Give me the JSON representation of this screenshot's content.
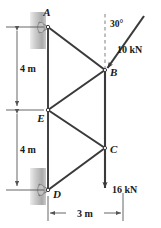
{
  "figure": {
    "type": "truss-free-body-diagram",
    "background_color": "#ffffff",
    "member_color": "#3a3a3a",
    "dimension_color": "#555555",
    "wall_color": "#b3b3b3",
    "support_color": "#9a9a9a"
  },
  "joints": {
    "A": {
      "label": "A",
      "x": 48,
      "y": 27,
      "support": "pin"
    },
    "B": {
      "label": "B",
      "x": 105,
      "y": 70,
      "support": "none"
    },
    "E": {
      "label": "E",
      "x": 48,
      "y": 110,
      "support": "none"
    },
    "C": {
      "label": "C",
      "x": 105,
      "y": 148,
      "support": "none"
    },
    "D": {
      "label": "D",
      "x": 48,
      "y": 190,
      "support": "pin"
    }
  },
  "members": [
    {
      "from": "A",
      "to": "E"
    },
    {
      "from": "E",
      "to": "D"
    },
    {
      "from": "A",
      "to": "B"
    },
    {
      "from": "E",
      "to": "B"
    },
    {
      "from": "E",
      "to": "C"
    },
    {
      "from": "D",
      "to": "C"
    },
    {
      "from": "B",
      "to": "C"
    }
  ],
  "loads": [
    {
      "name": "load-10kN",
      "label": "10 kN",
      "magnitude": 10,
      "unit": "kN",
      "applied_at": "B",
      "angle_label": "30°",
      "angle_value": 30,
      "angle_reference": "vertical",
      "direction": "down-left"
    },
    {
      "name": "load-16kN",
      "label": "16 kN",
      "magnitude": 16,
      "unit": "kN",
      "applied_at": "C",
      "direction": "down"
    }
  ],
  "dimensions": [
    {
      "name": "dim-upper-4m",
      "label": "4 m",
      "value": 4,
      "unit": "m",
      "orientation": "vertical",
      "span": "A-to-E"
    },
    {
      "name": "dim-lower-4m",
      "label": "4 m",
      "value": 4,
      "unit": "m",
      "orientation": "vertical",
      "span": "E-to-D"
    },
    {
      "name": "dim-3m",
      "label": "3 m",
      "value": 3,
      "unit": "m",
      "orientation": "horizontal",
      "span": "left-chord-to-right-chord"
    }
  ]
}
